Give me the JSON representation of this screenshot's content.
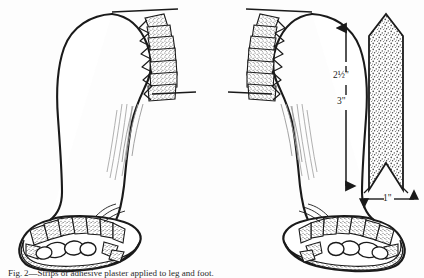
{
  "figure": {
    "background_color": "#fdfdfd",
    "ink_color": "#1a1a1a",
    "stipple_color": "#555555"
  },
  "dimensions": {
    "vertical_upper": "2½\"",
    "vertical_lower": "3\"",
    "horizontal_width": "1\""
  },
  "panels": [
    {
      "id": "left-leg",
      "label": "Left leg outer view with zigzag strips along calf and wrapped foot"
    },
    {
      "id": "right-leg",
      "label": "Right leg inner view with zigzag strips along calf and wrapped foot"
    },
    {
      "id": "strip-pattern",
      "label": "Stippled fabric strip, pointed top, swallowtail notched bottom"
    }
  ],
  "caption": {
    "text": "Fig. 2—Strips of adhesive plaster applied to leg and foot."
  }
}
